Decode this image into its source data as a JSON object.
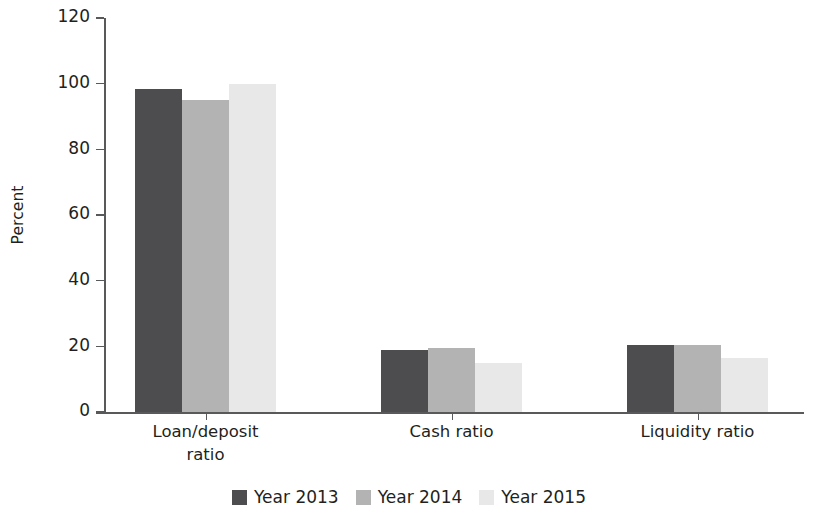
{
  "chart_data": {
    "type": "bar",
    "title": "",
    "subtitle": "",
    "xlabel": "",
    "ylabel": "Percent",
    "ylim": [
      0,
      120
    ],
    "yticks": [
      0,
      20,
      40,
      60,
      80,
      100,
      120
    ],
    "ytick_labels": [
      "0",
      "20",
      "40",
      "60",
      "80",
      "100",
      "120"
    ],
    "grid": false,
    "legend_position": "bottom",
    "categories": [
      "Loan/deposit\nratio",
      "Cash ratio",
      "Liquidity ratio"
    ],
    "series": [
      {
        "name": "Year 2013",
        "color": "#4d4d4f",
        "values": [
          98.5,
          19.0,
          20.5
        ]
      },
      {
        "name": "Year 2014",
        "color": "#b3b3b3",
        "values": [
          95.0,
          19.5,
          20.5
        ]
      },
      {
        "name": "Year 2015",
        "color": "#e8e8e8",
        "values": [
          100.0,
          15.0,
          16.5
        ]
      }
    ]
  },
  "legend": {
    "items": [
      {
        "label": "Year 2013",
        "color": "#4d4d4f"
      },
      {
        "label": "Year 2014",
        "color": "#b3b3b3"
      },
      {
        "label": "Year 2015",
        "color": "#e8e8e8"
      }
    ]
  },
  "axes": {
    "y_title": "Percent",
    "y_tick_0": "0",
    "y_tick_1": "20",
    "y_tick_2": "40",
    "y_tick_3": "60",
    "y_tick_4": "80",
    "y_tick_5": "100",
    "y_tick_6": "120",
    "x_cat_0": "Loan/deposit\nratio",
    "x_cat_1": "Cash ratio",
    "x_cat_2": "Liquidity ratio"
  }
}
